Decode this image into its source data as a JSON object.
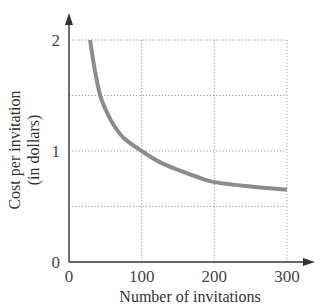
{
  "chart_data": {
    "type": "line",
    "title": "",
    "xlabel": "Number of invitations",
    "ylabel": "Cost per invitation (in dollars)",
    "ylabel_lines": [
      "Cost per invitation",
      "(in dollars)"
    ],
    "xlim": [
      0,
      300
    ],
    "ylim": [
      0,
      2
    ],
    "x_ticks": [
      0,
      100,
      200,
      300
    ],
    "y_ticks": [
      0,
      1,
      2
    ],
    "x_tick_labels": [
      "0",
      "100",
      "200",
      "300"
    ],
    "y_tick_labels": [
      "0",
      "1",
      "2"
    ],
    "x_gridlines": [
      100,
      200,
      300
    ],
    "y_gridlines": [
      0.5,
      1,
      1.5,
      2
    ],
    "grid": true,
    "grid_style": "dotted",
    "legend": null,
    "series": [
      {
        "name": "Cost per invitation",
        "color": "#8c8c8c",
        "x": [
          29,
          35,
          43,
          50,
          60,
          75,
          100,
          125,
          150,
          175,
          200,
          250,
          300
        ],
        "y": [
          2.0,
          1.75,
          1.5,
          1.38,
          1.25,
          1.12,
          1.0,
          0.9,
          0.83,
          0.77,
          0.72,
          0.68,
          0.65
        ]
      }
    ]
  }
}
